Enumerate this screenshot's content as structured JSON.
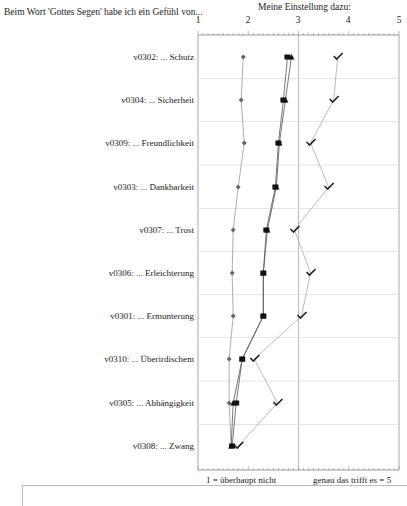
{
  "header": {
    "question": "Beim Wort 'Gottes Segen' habe ich ein Gefühl von...",
    "scale_title": "Meine Einstellung dazu:"
  },
  "axis": {
    "ticks": [
      "1",
      "2",
      "3",
      "4",
      "5"
    ],
    "low_label": "1 = überhaupt nicht",
    "high_label": "genau das trifft es = 5"
  },
  "chart_data": {
    "type": "line",
    "orientation": "horizontal-profile",
    "title": "Meine Einstellung dazu:",
    "xlabel": "",
    "ylabel": "Beim Wort 'Gottes Segen' habe ich ein Gefühl von...",
    "xlim": [
      1,
      5
    ],
    "x_ticks": [
      1,
      2,
      3,
      4,
      5
    ],
    "axis_end_labels": [
      "1 = überhaupt nicht",
      "genau das trifft es = 5"
    ],
    "grid": true,
    "categories": [
      "v0302: ... Schutz",
      "v0304: ... Sicherheit",
      "v0309: ... Freundlichkeit",
      "v0303: ... Dankbarkeit",
      "v0307: ... Trost",
      "v0306: ... Erleichterung",
      "v0301: ... Ermunterung",
      "v0310: ... Überirdischem",
      "v0305: ... Abhängigkeit",
      "v0308: ... Zwang"
    ],
    "series": [
      {
        "name": "diamond",
        "marker": "diamond",
        "color": "#666666",
        "values": [
          1.9,
          1.86,
          1.92,
          1.8,
          1.7,
          1.68,
          1.7,
          1.62,
          1.62,
          1.66
        ]
      },
      {
        "name": "square",
        "marker": "square",
        "color": "#111111",
        "values": [
          2.78,
          2.7,
          2.6,
          2.54,
          2.36,
          2.3,
          2.3,
          1.88,
          1.76,
          1.68
        ]
      },
      {
        "name": "triangle",
        "marker": "triangle",
        "color": "#111111",
        "values": [
          2.86,
          2.74,
          2.62,
          2.56,
          2.38,
          2.3,
          2.3,
          1.88,
          1.7,
          1.66
        ]
      },
      {
        "name": "check",
        "marker": "check",
        "color": "#222222",
        "values": [
          3.78,
          3.7,
          3.24,
          3.6,
          2.92,
          3.24,
          3.06,
          2.12,
          2.58,
          1.8
        ]
      }
    ]
  }
}
